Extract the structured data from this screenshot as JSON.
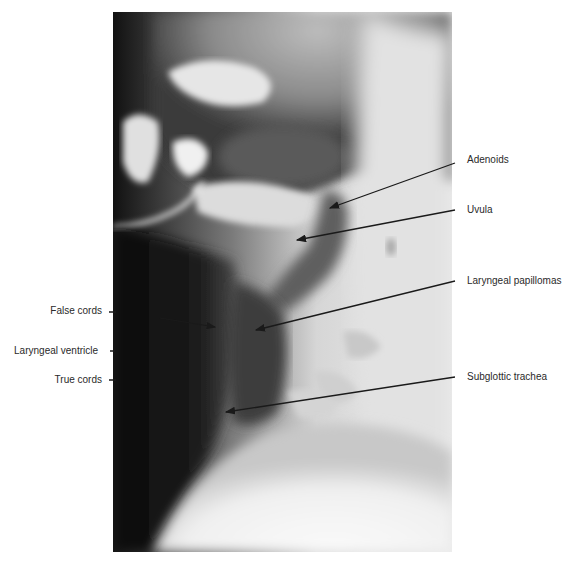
{
  "figure": {
    "labels_right": [
      {
        "text": "Adenoids",
        "x": 467,
        "y": 155,
        "arrow": {
          "x1": 455,
          "y1": 163,
          "x2": 330,
          "y2": 208
        }
      },
      {
        "text": "Uvula",
        "x": 467,
        "y": 205,
        "arrow": {
          "x1": 455,
          "y1": 210,
          "x2": 297,
          "y2": 240
        }
      },
      {
        "text": "Laryngeal papillomas",
        "x": 467,
        "y": 276,
        "arrow": {
          "x1": 455,
          "y1": 281,
          "x2": 256,
          "y2": 330
        }
      },
      {
        "text": "Subglottic trachea",
        "x": 467,
        "y": 372,
        "arrow": {
          "x1": 455,
          "y1": 377,
          "x2": 226,
          "y2": 412
        }
      }
    ],
    "labels_left": [
      {
        "text": "False cords",
        "right": 470,
        "y": 306,
        "tick": {
          "x1": 110,
          "y1": 312,
          "x2": 116,
          "y2": 312
        },
        "arrow": {
          "x1": 116,
          "y1": 312,
          "x2": 215,
          "y2": 328
        }
      },
      {
        "text": "Laryngeal ventricle",
        "right": 474,
        "y": 346,
        "tick": {
          "x1": 111,
          "y1": 351,
          "x2": 115,
          "y2": 351
        }
      },
      {
        "text": "True cords",
        "right": 470,
        "y": 375,
        "tick": {
          "x1": 110,
          "y1": 380,
          "x2": 116,
          "y2": 380
        }
      }
    ],
    "colors": {
      "background": "#ffffff",
      "label_text": "#2a2a2a",
      "arrow": "#1a1a1a",
      "xray_dark": "#0c0c0c",
      "xray_light": "#f2f2f2"
    }
  }
}
